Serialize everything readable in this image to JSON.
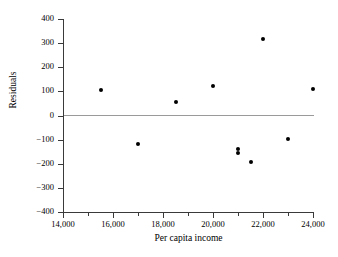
{
  "chart_data": {
    "type": "scatter",
    "title": "",
    "xlabel": "Per capita income",
    "ylabel": "Residuals",
    "xlim": [
      14000,
      24000
    ],
    "ylim": [
      -400,
      400
    ],
    "grid": false,
    "legend": null,
    "reference_lines": [
      {
        "axis": "y",
        "value": 0,
        "color": "#9a9a9a"
      }
    ],
    "x_ticks": [
      14000,
      16000,
      18000,
      20000,
      22000,
      24000
    ],
    "x_tick_labels": [
      "14,000",
      "16,000",
      "18,000",
      "20,000",
      "22,000",
      "24,000"
    ],
    "x_minor_ticks": [
      15000,
      17000,
      19000,
      21000,
      23000
    ],
    "y_ticks": [
      400,
      300,
      200,
      100,
      0,
      -100,
      -200,
      -300,
      -400
    ],
    "y_tick_labels": [
      "400",
      "300",
      "200",
      "100",
      "0",
      "−100",
      "−200",
      "−300",
      "−400"
    ],
    "points": [
      {
        "x": 15500,
        "y": 105
      },
      {
        "x": 17000,
        "y": -120
      },
      {
        "x": 18500,
        "y": 57
      },
      {
        "x": 20000,
        "y": 122
      },
      {
        "x": 21000,
        "y": -140
      },
      {
        "x": 21000,
        "y": -157
      },
      {
        "x": 21500,
        "y": -193
      },
      {
        "x": 22000,
        "y": 318
      },
      {
        "x": 23000,
        "y": -98
      },
      {
        "x": 24000,
        "y": 110
      }
    ],
    "marker": {
      "shape": "circle",
      "color": "#000000",
      "size": 4
    }
  }
}
